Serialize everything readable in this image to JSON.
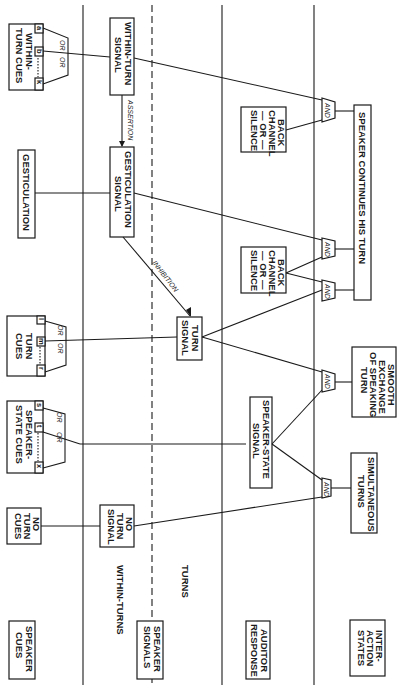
{
  "diagram": {
    "orientation": "rotated 90 degrees clockwise",
    "columns": {
      "speaker_cues": "SPEAKER CUES",
      "speaker_signals": "SPEAKER SIGNALS",
      "auditor_response": "AUDITOR RESPONSE",
      "interaction_states": "INTER-ACTION STATES"
    },
    "signal_subcolumns": {
      "within_turns": "WITHIN-TURNS",
      "turns": "TURNS"
    },
    "cues": {
      "within_turn_cues": {
        "title": "WITHIN-TURN CUES",
        "line1": "WITHIN-",
        "line2": "TURN CUES",
        "keys": [
          "a",
          "b",
          "k"
        ]
      },
      "gesticulation": {
        "title": "GESTICULATION"
      },
      "turn_cues": {
        "title": "TURN CUES",
        "line1": "TURN",
        "line2": "CUES",
        "keys": [
          "l",
          "m",
          "r"
        ]
      },
      "speaker_state_cues": {
        "title": "SPEAKER-STATE CUES",
        "line1": "SPEAKER-",
        "line2": "STATE CUES",
        "keys": [
          "s",
          "t",
          "x"
        ]
      },
      "no_turn_cues": {
        "title": "NO TURN CUES",
        "line1": "NO",
        "line2": "TURN",
        "line3": "CUES"
      }
    },
    "gates": {
      "or": "OR",
      "and": "AND"
    },
    "signals": {
      "within_turn_signal": {
        "line1": "WITHIN-TURN",
        "line2": "SIGNAL"
      },
      "gesticulation_signal": {
        "line1": "GESTICULATION",
        "line2": "SIGNAL"
      },
      "turn_signal": {
        "line1": "TURN",
        "line2": "SIGNAL"
      },
      "speaker_state_signal": {
        "line1": "SPEAKER-STATE",
        "line2": "SIGNAL"
      },
      "no_turn_signal": {
        "line1": "NO",
        "line2": "TURN",
        "line3": "SIGNAL"
      }
    },
    "relations": {
      "assertion": "ASSERTION",
      "inhibition": "INHIBITION"
    },
    "auditor": {
      "back_channel_1": {
        "line1": "BACK",
        "line2": "CHANNEL",
        "line3": "— OR —",
        "line4": "SILENCE"
      },
      "back_channel_2": {
        "line1": "BACK",
        "line2": "CHANNEL",
        "line3": "— OR —",
        "line4": "SILENCE"
      }
    },
    "states": {
      "speaker_continues": "SPEAKER CONTINUES HIS TURN",
      "smooth_exchange": {
        "line1": "SMOOTH",
        "line2": "EXCHANGE",
        "line3": "OF SPEAKING",
        "line4": "TURN"
      },
      "simultaneous_turns": {
        "line1": "SIMULTANEOUS",
        "line2": "TURNS"
      }
    }
  }
}
